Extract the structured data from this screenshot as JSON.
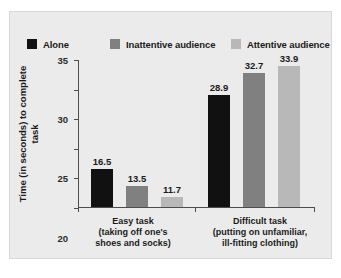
{
  "chart_data": {
    "type": "bar",
    "title": "",
    "subtitle": "",
    "xlabel": "",
    "ylabel": "Time (in seconds) to complete task",
    "ylim": [
      10,
      35
    ],
    "yticks": [
      35,
      30,
      25,
      20,
      15,
      10
    ],
    "ytick_labels": [
      "35",
      "30",
      "25",
      "20",
      "15",
      "10"
    ],
    "grid": false,
    "legend_position": "top-left",
    "categories": [
      {
        "title": "Easy task",
        "subtitle": "(taking off one's\nshoes and socks)",
        "sub_line_1": "(taking off one's",
        "sub_line_2": "shoes and socks)"
      },
      {
        "title": "Difficult task",
        "subtitle": "(putting on unfamiliar,\nill-fitting clothing)",
        "sub_line_1": "(putting on unfamiliar,",
        "sub_line_2": "ill-fitting clothing)"
      }
    ],
    "series": [
      {
        "name": "Alone",
        "color": "#111111",
        "values": [
          16.5,
          28.9
        ],
        "labels": [
          "16.5",
          "28.9"
        ]
      },
      {
        "name": "Inattentive audience",
        "color": "#808080",
        "values": [
          13.5,
          32.7
        ],
        "labels": [
          "13.5",
          "32.7"
        ]
      },
      {
        "name": "Attentive audience",
        "color": "#b8b8b8",
        "values": [
          11.7,
          33.9
        ],
        "labels": [
          "11.7",
          "33.9"
        ]
      }
    ]
  },
  "legend": {
    "items": [
      {
        "label": "Alone",
        "color": "#111111"
      },
      {
        "label": "Inattentive audience",
        "color": "#808080"
      },
      {
        "label": "Attentive audience",
        "color": "#b8b8b8"
      }
    ]
  },
  "axes": {
    "y_title_line_1": "Time (in seconds) to complete",
    "y_title_line_2": "task",
    "y_title": "Time (in seconds) to complete task"
  },
  "colors": {
    "panel_background": "#ebebeb",
    "panel_border": "#d8d8d8",
    "axis": "#4c4c4c",
    "text": "#1b1b1b",
    "series_alone": "#111111",
    "series_inattentive": "#808080",
    "series_attentive": "#b8b8b8"
  }
}
